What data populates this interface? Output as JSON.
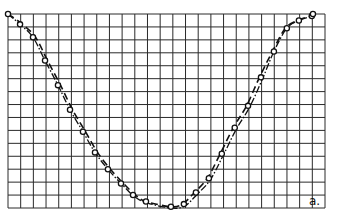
{
  "chart_data": {
    "type": "line",
    "title": "",
    "xlabel": "",
    "ylabel": "",
    "annotation": "a.",
    "grid": true,
    "grid_columns": 25,
    "grid_rows": 15,
    "xlim": [
      0,
      25
    ],
    "ylim": [
      0,
      15
    ],
    "legend": [],
    "series": [
      {
        "name": "measured points",
        "style": "circles",
        "x": [
          0,
          0.95,
          1.97,
          2.92,
          3.94,
          4.89,
          5.91,
          6.86,
          7.88,
          8.91,
          9.86,
          10.88,
          12.85,
          13.87,
          14.82,
          15.84,
          16.86,
          17.88,
          18.93,
          19.95,
          20.97,
          21.99,
          22.94,
          23.96,
          24.05
        ],
        "y": [
          15,
          14.2,
          13.2,
          11.4,
          9.5,
          7.6,
          5.9,
          4.3,
          3.0,
          1.9,
          1.0,
          0.5,
          0.1,
          0.3,
          1.2,
          2.3,
          4.2,
          6.2,
          7.9,
          10.1,
          12.1,
          13.9,
          14.5,
          14.85,
          15
        ]
      },
      {
        "name": "curve (dashed)",
        "style": "dashed",
        "shape": "cosine-like trough, max at x=0 and x=24, min near x=12.5"
      },
      {
        "name": "curve (dash-dot)",
        "style": "dash-dot",
        "shape": "closely follows dashed curve, slight deviation in lower region"
      }
    ]
  }
}
